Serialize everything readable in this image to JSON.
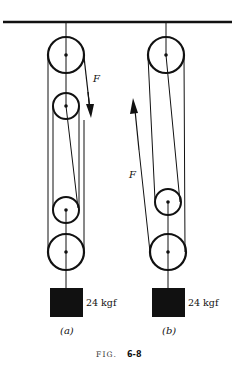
{
  "figure": {
    "caption_prefix": "FIG.",
    "caption_number": "6-8"
  },
  "panels": [
    {
      "id": "a",
      "label": "(a)",
      "force_label": "F",
      "force_direction": "down",
      "load_label": "24 kgf",
      "pulleys": [
        {
          "role": "fixed-top",
          "cx": 66,
          "cy": 55,
          "r": 18
        },
        {
          "role": "upper-small",
          "cx": 66,
          "cy": 106,
          "r": 13
        },
        {
          "role": "lower-small",
          "cx": 66,
          "cy": 210,
          "r": 13
        },
        {
          "role": "lower-large",
          "cx": 66,
          "cy": 252,
          "r": 18
        }
      ]
    },
    {
      "id": "b",
      "label": "(b)",
      "force_label": "F",
      "force_direction": "up",
      "load_label": "24 kgf",
      "pulleys": [
        {
          "role": "fixed-top",
          "cx": 166,
          "cy": 55,
          "r": 18
        },
        {
          "role": "lower-small",
          "cx": 168,
          "cy": 202,
          "r": 13
        },
        {
          "role": "lower-large",
          "cx": 168,
          "cy": 252,
          "r": 18
        }
      ]
    }
  ],
  "colors": {
    "ink": "#111111",
    "paper": "#ffffff"
  }
}
